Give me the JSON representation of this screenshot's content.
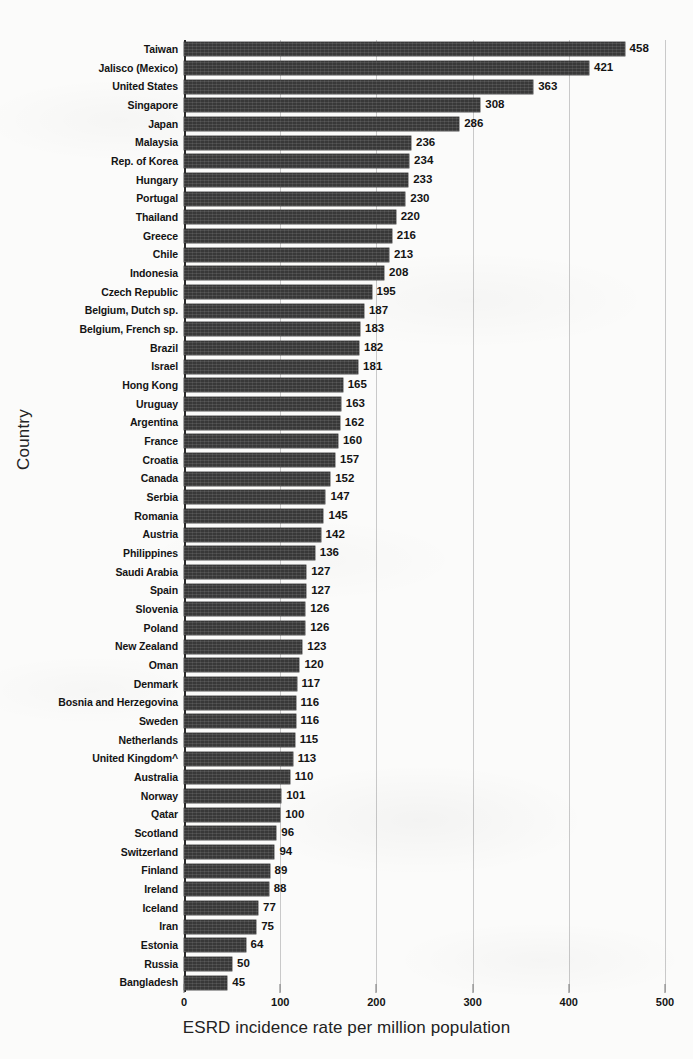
{
  "chart_data": {
    "type": "bar",
    "orientation": "horizontal",
    "title": "",
    "xlabel": "ESRD incidence rate per million population",
    "ylabel": "Country",
    "xlim": [
      0,
      500
    ],
    "xticks": [
      0,
      100,
      200,
      300,
      400,
      500
    ],
    "grid": true,
    "legend": null,
    "bar_color": "#383838",
    "categories": [
      "Taiwan",
      "Jalisco (Mexico)",
      "United States",
      "Singapore",
      "Japan",
      "Malaysia",
      "Rep. of Korea",
      "Hungary",
      "Portugal",
      "Thailand",
      "Greece",
      "Chile",
      "Indonesia",
      "Czech Republic",
      "Belgium, Dutch sp.",
      "Belgium, French sp.",
      "Brazil",
      "Israel",
      "Hong Kong",
      "Uruguay",
      "Argentina",
      "France",
      "Croatia",
      "Canada",
      "Serbia",
      "Romania",
      "Austria",
      "Philippines",
      "Saudi Arabia",
      "Spain",
      "Slovenia",
      "Poland",
      "New Zealand",
      "Oman",
      "Denmark",
      "Bosnia and Herzegovina",
      "Sweden",
      "Netherlands",
      "United Kingdom^",
      "Australia",
      "Norway",
      "Qatar",
      "Scotland",
      "Switzerland",
      "Finland",
      "Ireland",
      "Iceland",
      "Iran",
      "Estonia",
      "Russia",
      "Bangladesh"
    ],
    "values": [
      458,
      421,
      363,
      308,
      286,
      236,
      234,
      233,
      230,
      220,
      216,
      213,
      208,
      195,
      187,
      183,
      182,
      181,
      165,
      163,
      162,
      160,
      157,
      152,
      147,
      145,
      142,
      136,
      127,
      127,
      126,
      126,
      123,
      120,
      117,
      116,
      116,
      115,
      113,
      110,
      101,
      100,
      96,
      94,
      89,
      88,
      77,
      75,
      64,
      50,
      45
    ]
  }
}
